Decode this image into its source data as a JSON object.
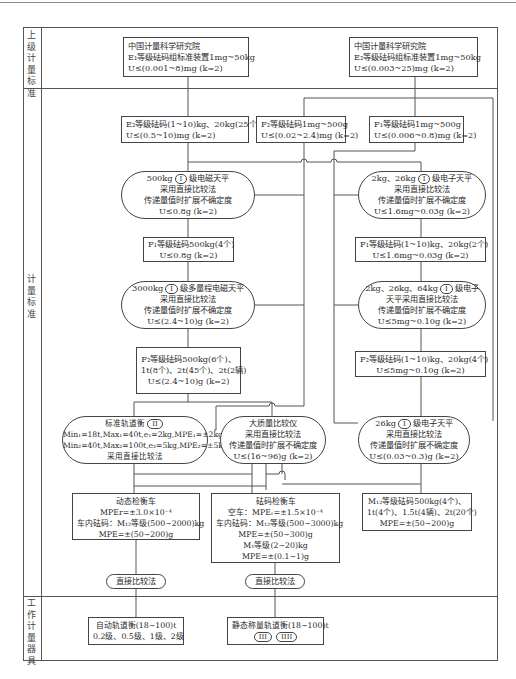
{
  "sections": {
    "upper_standard": "上级计量标准",
    "measurement_standard": "计量标准",
    "working_instrument": "工作计量器具"
  },
  "upper": {
    "left": {
      "line1": "中国计量科学研究院",
      "line2": "E₁等级砝码组标准装置1mg~50kg",
      "line3": "U≤(0.001~8)mg (k=2)"
    },
    "right": {
      "line1": "中国计量科学研究院",
      "line2": "E₂等级砝码组标准装置1mg~50kg",
      "line3": "U≤(0.003~25)mg (k=2)"
    }
  },
  "standards": {
    "e2_weights": {
      "line1": "E₂等级砝码(1~10)kg、20kg(25个)",
      "line2": "U≤(0.5~10)mg (k=2)"
    },
    "f2_weights_small": {
      "line1": "F₂等级砝码1mg~500g",
      "line2": "U≤(0.02~2.4)mg (k=2)"
    },
    "f1_weights_small": {
      "line1": "F₁等级砝码1mg~500g",
      "line2": "U≤(0.006~0.8)mg (k=2)"
    },
    "balance_500kg": {
      "line1_pre": "500kg",
      "badge": "I",
      "line1_post": "级电磁天平",
      "line2": "采用直接比较法",
      "line3": "传递量值时扩展不确定度",
      "line4": "U≤0.8g (k=2)"
    },
    "balance_2kg_26kg": {
      "line1_pre": "2kg、26kg",
      "badge": "I",
      "line1_post": "级电子天平",
      "line2": "采用直接比较法",
      "line3": "传递量值时扩展不确定度",
      "line4": "U≤1.6mg~0.03g (k=2)"
    },
    "f1_500kg": {
      "line1": "F₁等级砝码500kg(4个)",
      "line2": "U≤0.8g (k=2)"
    },
    "f1_1_10kg": {
      "line1": "F₁等级砝码(1~10)kg、20kg(2个)",
      "line2": "U≤1.6mg~0.03g (k=2)"
    },
    "balance_3000kg": {
      "line1_pre": "3000kg",
      "badge": "I",
      "line1_post": "级多量程电磁天平",
      "line2": "采用直接比较法",
      "line3": "传递量值时扩展不确定度",
      "line4": "U≤(2.4~10)g (k=2)"
    },
    "balance_64kg": {
      "line1_pre": "2kg、26kg、64kg",
      "badge": "I",
      "line1_post": "级电子",
      "line2": "天平采用直接比较法",
      "line3": "传递量值时扩展不确定度",
      "line4": "U≤5mg~0.10g (k=2)"
    },
    "f2_500kg": {
      "line1": "F₂等级砝码500kg(6个)、",
      "line2": "1t(8个)、2t(45个)、2t(2辆)",
      "line3": "U≤(2.4~10)g (k=2)"
    },
    "f2_1_10kg": {
      "line1": "F₂等级砝码(1~10)kg、20kg(4个)",
      "line2": "U≤5mg~0.10g (k=2)"
    },
    "track_scale": {
      "line1_pre": "标准轨道衡",
      "badge": "II",
      "line2": "Min₁=18t,Max₁=40t,e₁=2kg,MPE₁=±2kg",
      "line3": "Min₂=40t,Max₂=100t,e₂=5kg,MPE₂=±5kg",
      "line4": "采用直接比较法"
    },
    "mass_comparator": {
      "line1": "大质量比较仪",
      "line2": "采用直接比较法",
      "line3": "传递量值时扩展不确定度",
      "line4": "U≤(16~96)g (k=2)"
    },
    "balance_26kg": {
      "line1_pre": "26kg",
      "badge": "I",
      "line1_post": "级电子天平",
      "line2": "采用直接比较法",
      "line3": "传递量值时扩展不确定度",
      "line4": "U≤(0.03~0.3)g (k=2)"
    },
    "dynamic_car": {
      "line1": "动态检衡车",
      "line2": "MPEr=±3.0×10⁻⁴",
      "line3": "车内砝码：M₁₂等级(500~2000)kg",
      "line4": "MPE=±(50~200)g"
    },
    "weight_car": {
      "line1": "砝码检衡车",
      "line2": "空车：MPEᵣ=±1.5×10⁻⁴",
      "line3": "车内砝码：M₁₂等级(500~3000)kg",
      "line4": "MPE=±(50~300)g",
      "line5": "M₁等级(2~20)kg",
      "line6": "MPE=±(0.1~1)g"
    },
    "m12_weights": {
      "line1": "M₁₂等级砝码500kg(4个)、",
      "line2": "1t(4个)、1.5t(4辆)、2t(20个)",
      "line3": "MPE=±(50~200)g"
    },
    "method_left": "直接比较法",
    "method_mid": "直接比较法"
  },
  "working": {
    "auto_track": {
      "line1": "自动轨道衡(18~100)t",
      "line2": "0.2级、0.5级、1级、2级"
    },
    "static_track": {
      "line1": "静态称量轨道衡(18~100)t",
      "badge1": "III",
      "badge2": "IIII"
    }
  }
}
